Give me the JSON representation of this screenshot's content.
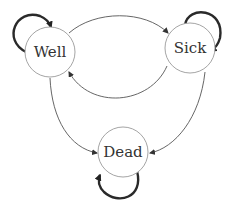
{
  "diagram": {
    "type": "state-transition",
    "states": [
      {
        "id": "well",
        "label": "Well"
      },
      {
        "id": "sick",
        "label": "Sick"
      },
      {
        "id": "dead",
        "label": "Dead"
      }
    ],
    "transitions": [
      {
        "from": "Well",
        "to": "Well",
        "style": "thick self-loop"
      },
      {
        "from": "Well",
        "to": "Sick",
        "style": "thin curved (top)"
      },
      {
        "from": "Sick",
        "to": "Well",
        "style": "thin curved (bottom)"
      },
      {
        "from": "Well",
        "to": "Dead",
        "style": "thin curved"
      },
      {
        "from": "Sick",
        "to": "Sick",
        "style": "thick self-loop"
      },
      {
        "from": "Sick",
        "to": "Dead",
        "style": "thin curved"
      },
      {
        "from": "Dead",
        "to": "Dead",
        "style": "thick self-loop"
      }
    ]
  }
}
